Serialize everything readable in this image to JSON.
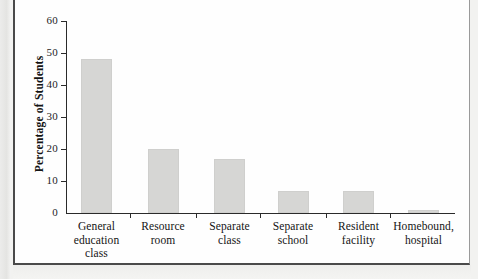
{
  "figure": {
    "background_color": "#fefefe",
    "frame_color": "#4a4a4a",
    "bar_color": "#d6d6d4",
    "axis_color": "#2a2a2a"
  },
  "chart_data": {
    "type": "bar",
    "title": "",
    "xlabel": "",
    "ylabel": "Percentage of Students",
    "categories": [
      "General education class",
      "Resource room",
      "Separate class",
      "Separate school",
      "Resident facility",
      "Homebound, hospital"
    ],
    "category_lines": [
      [
        "General",
        "education",
        "class"
      ],
      [
        "Resource",
        "room"
      ],
      [
        "Separate",
        "class"
      ],
      [
        "Separate",
        "school"
      ],
      [
        "Resident",
        "facility"
      ],
      [
        "Homebound,",
        "hospital"
      ]
    ],
    "values": [
      48,
      20,
      17,
      7,
      7,
      1
    ],
    "ylim": [
      0,
      60
    ],
    "yticks": [
      0,
      10,
      20,
      30,
      40,
      50,
      60
    ],
    "ytick_labels": [
      "0",
      "10",
      "20",
      "30",
      "40",
      "50",
      "60"
    ],
    "grid": false,
    "legend": null
  }
}
